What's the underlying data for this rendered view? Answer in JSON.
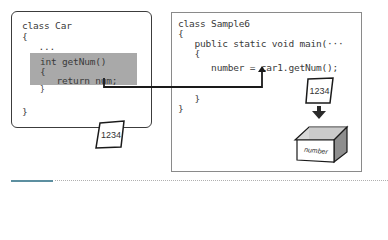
{
  "left_panel": {
    "title": "class Car",
    "lines": [
      "class Car",
      "{",
      "   ...",
      "}"
    ],
    "method": {
      "lines": [
        "int getNum()",
        "{",
        "   return num;",
        "}"
      ]
    },
    "return_value_card": "1234"
  },
  "right_panel": {
    "lines": [
      "class Sample6",
      "{",
      "   public static void main(···",
      "   {",
      "      number = car1.getNum();",
      "   }",
      "}"
    ],
    "value_card": "1234",
    "variable_box_label": "number"
  },
  "colors": {
    "left_border": "#3c3c3c",
    "right_border": "#8a8a8a",
    "method_bg": "#a9a9a9",
    "footer_accent": "#5c8fa0"
  }
}
